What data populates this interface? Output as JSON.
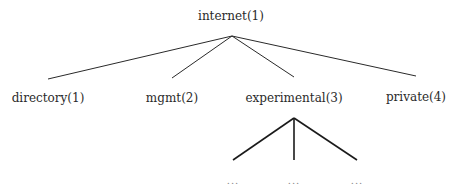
{
  "diagram": {
    "type": "tree",
    "root": {
      "label": "internet(1)"
    },
    "children": [
      {
        "label": "directory(1)"
      },
      {
        "label": "mgmt(2)"
      },
      {
        "label": "experimental(3)",
        "children": [
          {
            "label": "..."
          },
          {
            "label": "..."
          },
          {
            "label": "..."
          }
        ]
      },
      {
        "label": "private(4)"
      }
    ],
    "colors": {
      "line": "#2a2a2a",
      "text": "#2a2a2a",
      "ellipsis": "#888888",
      "background": "#ffffff"
    }
  }
}
